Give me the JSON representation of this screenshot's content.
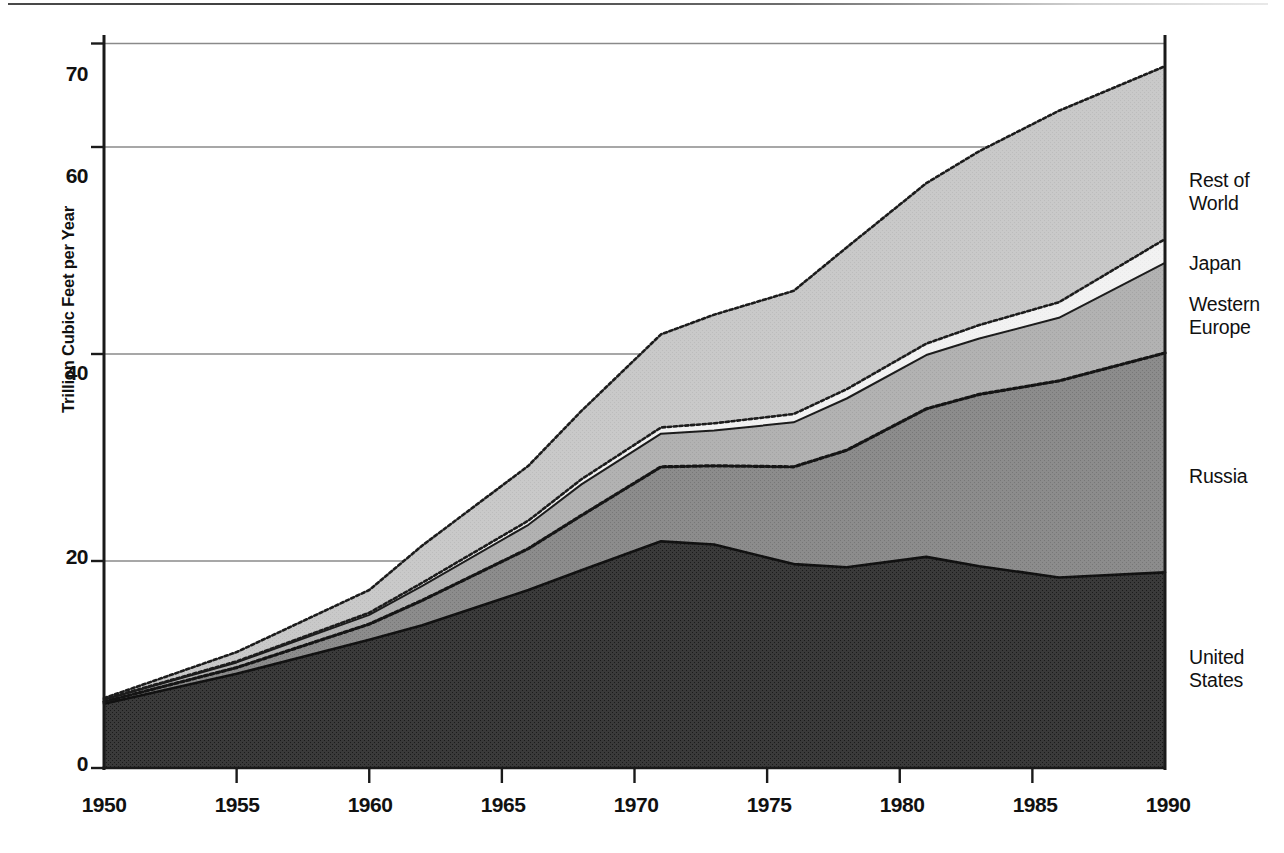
{
  "figure": {
    "kind": "stacked-area-chart",
    "background": "#ffffff"
  },
  "axes": {
    "y_axis_title": "Trillion Cubic Feet per Year",
    "y_ticks": [
      "0",
      "20",
      "40",
      "60",
      "70"
    ],
    "x_ticks": [
      "1950",
      "1955",
      "1960",
      "1965",
      "1970",
      "1975",
      "1980",
      "1985",
      "1990"
    ]
  },
  "series_labels": {
    "rest_of_world": "Rest of\nWorld",
    "japan": "Japan",
    "western_europe": "Western\nEurope",
    "russia": "Russia",
    "united_states": "United\nStates"
  },
  "colors": {
    "united_states": "#3a3a3a",
    "russia": "#8c8c8c",
    "western_europe": "#b2b2b2",
    "japan": "#f2f2f2",
    "rest_of_world": "#c9c9c9",
    "axis": "#1a1a1a",
    "gridline": "#8a8a8a"
  },
  "chart_data": {
    "type": "area",
    "stacked": true,
    "title": "",
    "xlabel": "",
    "ylabel": "Trillion Cubic Feet per Year",
    "xlim": [
      1950,
      1990
    ],
    "ylim": [
      0,
      75
    ],
    "yticks": [
      0,
      20,
      40,
      60,
      70
    ],
    "xticks": [
      1950,
      1955,
      1960,
      1965,
      1970,
      1975,
      1980,
      1985,
      1990
    ],
    "grid": "horizontal",
    "legend": "right-inline-labels",
    "x": [
      1950,
      1955,
      1960,
      1962,
      1966,
      1968,
      1971,
      1973,
      1976,
      1978,
      1981,
      1983,
      1986,
      1990
    ],
    "series": [
      {
        "name": "United States",
        "values": [
          6.2,
          9.1,
          12.4,
          13.8,
          17.2,
          19.1,
          21.9,
          21.6,
          19.7,
          19.4,
          20.4,
          19.5,
          18.4,
          18.9
        ]
      },
      {
        "name": "Russia",
        "values": [
          0.2,
          0.6,
          1.5,
          2.4,
          4.0,
          5.3,
          7.2,
          7.6,
          9.4,
          11.3,
          14.3,
          16.6,
          19.0,
          21.2
        ]
      },
      {
        "name": "Western Europe",
        "values": [
          0.2,
          0.5,
          0.9,
          1.4,
          2.3,
          3.0,
          3.2,
          3.4,
          4.3,
          5.0,
          5.2,
          5.4,
          6.1,
          8.7
        ]
      },
      {
        "name": "Japan",
        "values": [
          0.05,
          0.1,
          0.2,
          0.3,
          0.4,
          0.5,
          0.6,
          0.7,
          0.8,
          0.9,
          1.1,
          1.3,
          1.5,
          2.3
        ]
      },
      {
        "name": "Rest of World",
        "values": [
          0.1,
          0.9,
          2.2,
          3.6,
          5.3,
          6.6,
          9.0,
          10.5,
          11.9,
          13.7,
          15.5,
          16.8,
          18.5,
          16.7
        ]
      }
    ],
    "totals": [
      6.75,
      11.2,
      17.2,
      21.5,
      29.2,
      34.5,
      41.9,
      43.8,
      46.1,
      50.3,
      56.5,
      59.6,
      63.5,
      67.8
    ]
  }
}
